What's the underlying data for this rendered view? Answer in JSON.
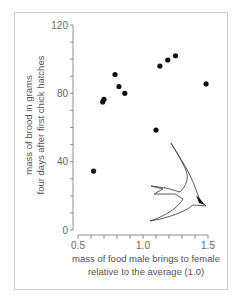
{
  "chart_data": {
    "type": "scatter",
    "title": "",
    "xlabel": "mass of food male brings to female relative to the average (1.0)",
    "xlabel_lines": [
      "mass of food male brings to female",
      "relative to the average (1.0)"
    ],
    "ylabel": "mass of brood in grams four days after first chick hatches",
    "ylabel_lines": [
      "mass of brood in grams",
      "four days after first chick hatches"
    ],
    "xlim": [
      0.5,
      1.5
    ],
    "ylim": [
      0,
      120
    ],
    "x_ticks": [
      "0.5",
      "1.0",
      "1.5"
    ],
    "x_minor_step": 0.1,
    "y_ticks": [
      "0",
      "40",
      "80",
      "120"
    ],
    "y_minor_step": 10,
    "grid": false,
    "legend": null,
    "series": [
      {
        "name": "broods",
        "points": [
          {
            "x": 0.62,
            "y": 34.5
          },
          {
            "x": 0.69,
            "y": 75
          },
          {
            "x": 0.7,
            "y": 76.5
          },
          {
            "x": 0.785,
            "y": 91
          },
          {
            "x": 0.815,
            "y": 84
          },
          {
            "x": 0.86,
            "y": 80
          },
          {
            "x": 1.1,
            "y": 58.5
          },
          {
            "x": 1.13,
            "y": 96
          },
          {
            "x": 1.19,
            "y": 99.5
          },
          {
            "x": 1.25,
            "y": 102
          },
          {
            "x": 1.485,
            "y": 85.5
          }
        ]
      }
    ],
    "annotations": [
      "tern-illustration"
    ]
  },
  "colors": {
    "points": "#111111",
    "axes": "#777777",
    "frame": "#cfcfcf"
  }
}
